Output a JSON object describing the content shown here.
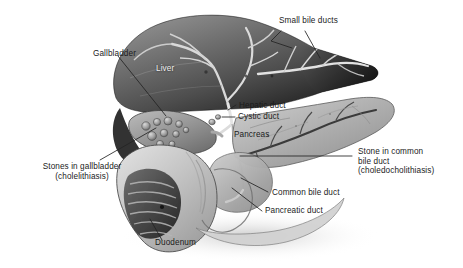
{
  "figure": {
    "background_color": "#ffffff",
    "label_color": "#1b1b1b",
    "on_organ_label_color": "#f2f2f2",
    "leader_line_color": "#2a2a2a",
    "width": 463,
    "height": 268
  },
  "labels": {
    "small_bile_ducts": "Small bile ducts",
    "gallbladder": "Gallbladder",
    "liver": "Liver",
    "hepatic_duct": "Hepatic duct",
    "cystic_duct": "Cystic duct",
    "pancreas": "Pancreas",
    "stones_in_gallbladder_line1": "Stones in gallbladder",
    "stones_in_gallbladder_line2": "(cholelithiasis)",
    "stone_in_common_bile_duct_line1": "Stone in common",
    "stone_in_common_bile_duct_line2": "bile duct",
    "stone_in_common_bile_duct_line3": "(choledocholithiasis)",
    "common_bile_duct": "Common bile duct",
    "pancreatic_duct": "Pancreatic duct",
    "duodenum": "Duodenum"
  },
  "structures": [
    {
      "name": "liver",
      "tone": "dark-gray"
    },
    {
      "name": "gallbladder",
      "tone": "mid-gray",
      "contains": "gallstones"
    },
    {
      "name": "pancreas",
      "tone": "light-gray"
    },
    {
      "name": "duodenum",
      "tone": "light-gray",
      "view": "cut-away"
    },
    {
      "name": "common-bile-duct",
      "tone": "light"
    },
    {
      "name": "pancreatic-duct",
      "tone": "dark"
    }
  ]
}
